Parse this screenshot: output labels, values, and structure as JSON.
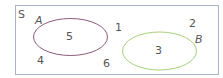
{
  "diagram": {
    "type": "venn",
    "universe": {
      "label": "S",
      "border_color": "#aab4d0"
    },
    "sets": [
      {
        "label": "A",
        "elements": [
          "5"
        ],
        "color": "#8c5a7a"
      },
      {
        "label": "B",
        "elements": [
          "3"
        ],
        "color": "#a8d07a"
      }
    ],
    "outside_elements": [
      "1",
      "2",
      "4",
      "6"
    ]
  }
}
